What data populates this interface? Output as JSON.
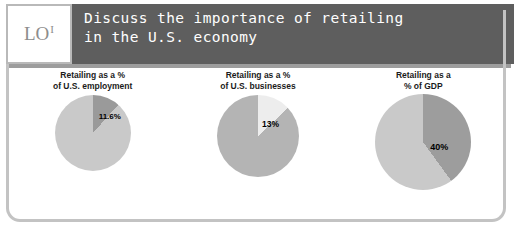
{
  "slide": {
    "badge": {
      "main": "LO",
      "superscript": "I",
      "icon_name": "learning-objective-badge"
    },
    "header": {
      "title": "Discuss the importance of retailing\nin the U.S. economy",
      "background_color": "#5e5e5e",
      "text_color": "#ffffff"
    },
    "frame_color": "#c3c3c3"
  },
  "chart_data": [
    {
      "type": "pie",
      "title": "Retailing as a %\nof U.S. employment",
      "categories": [
        "Retailing",
        "Other"
      ],
      "values": [
        11.6,
        88.4
      ],
      "labels": [
        "11.6%",
        ""
      ],
      "colors": [
        "#9a9a9a",
        "#c9c9c9"
      ],
      "highlight_label": "11.6%",
      "start_angle": 0,
      "legend": "none",
      "grid": false
    },
    {
      "type": "pie",
      "title": "Retailing as a %\nof U.S. businesses",
      "categories": [
        "Retailing",
        "Other"
      ],
      "values": [
        13,
        87
      ],
      "labels": [
        "13%",
        ""
      ],
      "colors": [
        "#ededed",
        "#b4b4b4"
      ],
      "highlight_label": "13%",
      "start_angle": 0,
      "legend": "none",
      "grid": false
    },
    {
      "type": "pie",
      "title": "Retailing as a\n% of GDP",
      "categories": [
        "Retailing",
        "Other"
      ],
      "values": [
        40,
        60
      ],
      "labels": [
        "40%",
        ""
      ],
      "colors": [
        "#9d9d9d",
        "#c9c9c9"
      ],
      "highlight_label": "40%",
      "start_angle": 0,
      "legend": "none",
      "grid": false
    }
  ]
}
